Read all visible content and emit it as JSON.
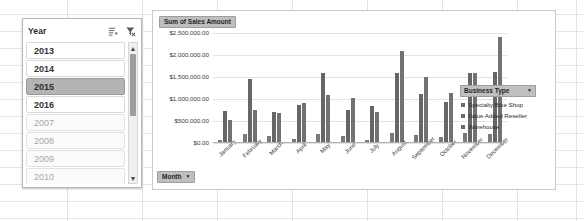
{
  "slicer": {
    "title": "Year",
    "icons": [
      {
        "name": "multi-select-icon"
      },
      {
        "name": "clear-filter-icon"
      }
    ],
    "items": [
      {
        "label": "2013",
        "state": "available"
      },
      {
        "label": "2014",
        "state": "available"
      },
      {
        "label": "2015",
        "state": "selected"
      },
      {
        "label": "2016",
        "state": "available"
      },
      {
        "label": "2007",
        "state": "no-data"
      },
      {
        "label": "2008",
        "state": "no-data"
      },
      {
        "label": "2009",
        "state": "no-data"
      },
      {
        "label": "2010",
        "state": "no-data"
      }
    ],
    "scroll_up": "▲",
    "scroll_down": "▼"
  },
  "chart": {
    "value_field_button": "Sum of Sales Amount",
    "axis_field_button": "Month",
    "field_button_arrow": "▼",
    "legend": {
      "title": "Business Type",
      "arrow": "▼",
      "items": [
        "Specialty Bike Shop",
        "Value Added Reseller",
        "Warehouse"
      ]
    }
  },
  "chart_data": {
    "type": "bar",
    "title": "Sum of Sales Amount",
    "xlabel": "Month",
    "ylabel": "",
    "ylim": [
      0,
      2500000
    ],
    "yticks": [
      0,
      500000,
      1000000,
      1500000,
      2000000,
      2500000
    ],
    "ytick_labels": [
      "$0.00",
      "$500,000.00",
      "$1,000,000.00",
      "$1,500,000.00",
      "$2,000,000.00",
      "$2,500,000.00"
    ],
    "grid": true,
    "legend_position": "right",
    "categories": [
      "January",
      "February",
      "March",
      "April",
      "May",
      "June",
      "July",
      "August",
      "September",
      "October",
      "November",
      "December"
    ],
    "series": [
      {
        "name": "Specialty Bike Shop",
        "values": [
          60000,
          200000,
          150000,
          80000,
          210000,
          160000,
          70000,
          220000,
          175000,
          140000,
          230000,
          200000
        ]
      },
      {
        "name": "Value Added Reseller",
        "values": [
          720000,
          1450000,
          700000,
          870000,
          1580000,
          760000,
          850000,
          1600000,
          1110000,
          940000,
          1580000,
          1620000
        ]
      },
      {
        "name": "Warehouse",
        "values": [
          520000,
          760000,
          680000,
          920000,
          1090000,
          1020000,
          700000,
          2100000,
          1500000,
          1130000,
          1600000,
          2400000
        ]
      }
    ]
  }
}
